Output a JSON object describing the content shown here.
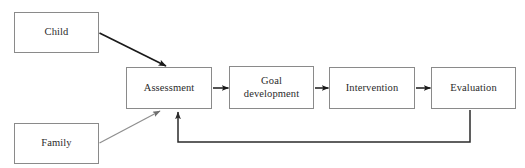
{
  "diagram": {
    "background_color": "#ffffff",
    "box_border_color": "#8a8a8a",
    "text_color": "#2b2b2b",
    "dark_arrow_color": "#1a1a1a",
    "gray_arrow_color": "#8f8f8f",
    "connector_color": "#2b2b2b",
    "nodes": [
      {
        "id": "child",
        "label": "Child"
      },
      {
        "id": "family",
        "label": "Family"
      },
      {
        "id": "assessment",
        "label": "Assessment"
      },
      {
        "id": "goal",
        "label": "Goal\ndevelopment"
      },
      {
        "id": "intervention",
        "label": "Intervention"
      },
      {
        "id": "evaluation",
        "label": "Evaluation"
      }
    ],
    "edges": [
      {
        "id": "child-to-assessment",
        "from": "child",
        "to": "assessment",
        "style": "diagonal-dark"
      },
      {
        "id": "family-to-assessment",
        "from": "family",
        "to": "assessment",
        "style": "diagonal-gray"
      },
      {
        "id": "assessment-to-goal",
        "from": "assessment",
        "to": "goal",
        "style": "short-horizontal"
      },
      {
        "id": "goal-to-intervention",
        "from": "goal",
        "to": "intervention",
        "style": "short-horizontal"
      },
      {
        "id": "intervention-to-evaluation",
        "from": "intervention",
        "to": "evaluation",
        "style": "short-horizontal"
      },
      {
        "id": "evaluation-to-assessment-feedback",
        "from": "evaluation",
        "to": "assessment",
        "style": "orthogonal-feedback"
      }
    ]
  }
}
